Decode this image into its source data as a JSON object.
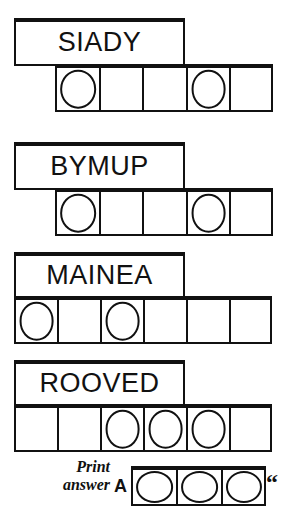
{
  "puzzle": {
    "type": "jumble-word-puzzle",
    "ink_color": "#111111",
    "paper_color": "#ffffff",
    "rows": [
      {
        "word": "SIADY",
        "cell_count": 5,
        "circled_positions": [
          1,
          4
        ],
        "grid_offset": "right"
      },
      {
        "word": "BYMUP",
        "cell_count": 5,
        "circled_positions": [
          1,
          4
        ],
        "grid_offset": "right"
      },
      {
        "word": "MAINEA",
        "cell_count": 6,
        "circled_positions": [
          1,
          3
        ],
        "grid_offset": "left"
      },
      {
        "word": "ROOVED",
        "cell_count": 6,
        "circled_positions": [
          3,
          4,
          5
        ],
        "grid_offset": "left"
      }
    ]
  },
  "answer": {
    "label_line1": "Print",
    "label_line2": "answer",
    "prefix": "A",
    "cell_count": 3,
    "quote": "“"
  }
}
